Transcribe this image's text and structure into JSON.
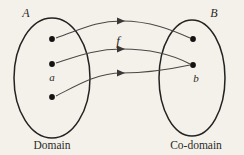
{
  "figure": {
    "kind": "function-mapping-diagram",
    "background_color": "#f4f1ea",
    "ink_color": "#232221",
    "curve_color": "#4a4845",
    "width": 244,
    "height": 155
  },
  "domain_set": {
    "name": "A",
    "caption": "Domain",
    "ellipse": {
      "cx": 52,
      "cy": 78,
      "rx": 38,
      "ry": 60
    },
    "label_pos": {
      "x": 26,
      "y": 17
    },
    "caption_pos": {
      "x": 52,
      "y": 148
    },
    "elements": [
      {
        "id": "a1",
        "label": "",
        "x": 52,
        "y": 39
      },
      {
        "id": "a2",
        "label": "",
        "x": 52,
        "y": 64
      },
      {
        "id": "a3",
        "label": "a",
        "x": 52,
        "y": 97,
        "label_x": 52,
        "label_y": 80
      }
    ]
  },
  "codomain_set": {
    "name": "B",
    "caption": "Co-domain",
    "ellipse": {
      "cx": 192,
      "cy": 78,
      "rx": 33,
      "ry": 58
    },
    "label_pos": {
      "x": 214,
      "y": 17
    },
    "caption_pos": {
      "x": 196,
      "y": 148
    },
    "elements": [
      {
        "id": "b1",
        "label": "",
        "x": 193,
        "y": 39
      },
      {
        "id": "b2",
        "label": "b",
        "x": 193,
        "y": 65,
        "label_x": 195,
        "label_y": 81
      }
    ]
  },
  "mapping": {
    "name": "f",
    "label_pos": {
      "x": 118,
      "y": 45
    },
    "arrows": [
      {
        "id": "arrow-top",
        "from": "a1",
        "to": "b1",
        "path": "M 56 38 C 80 30 95 21 122 21 C 150 21 172 30 190 38",
        "head": {
          "x": 123,
          "y": 21,
          "angle": 0
        }
      },
      {
        "id": "arrow-middle",
        "from": "a2",
        "to": "b2",
        "path": "M 56 63 C 78 56 96 49 122 49 C 152 49 175 56 190 64",
        "head": {
          "x": 123,
          "y": 49,
          "angle": 0
        }
      },
      {
        "id": "arrow-bottom",
        "from": "a3",
        "to": "b2",
        "path": "M 56 96 C 76 86 96 73 122 73 C 150 73 176 68 190 65",
        "head": {
          "x": 123,
          "y": 73,
          "angle": 0
        }
      }
    ]
  }
}
